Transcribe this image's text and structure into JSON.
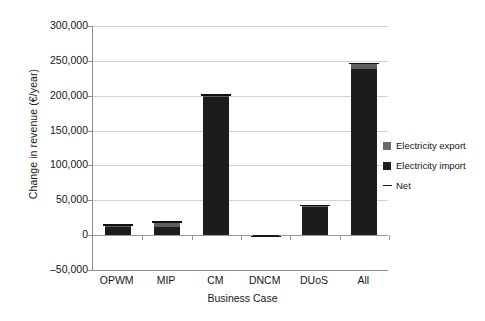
{
  "chart_data": {
    "type": "bar",
    "title": "",
    "subtitle": "",
    "xlabel": "Business Case",
    "ylabel": "Change in revenue (€/year)",
    "categories": [
      "OPWM",
      "MIP",
      "CM",
      "DNCM",
      "DUoS",
      "All"
    ],
    "ylim": [
      -50000,
      300000
    ],
    "ytick_labels": [
      "300,000",
      "250,000",
      "200,000",
      "150,000",
      "100,000",
      "50,000",
      "0",
      "–50,000"
    ],
    "ytick_values": [
      300000,
      250000,
      200000,
      150000,
      100000,
      50000,
      0,
      -50000
    ],
    "grid": true,
    "stacked": true,
    "legend_position": "right",
    "series": [
      {
        "name": "Electricity import",
        "color": "#1c1c1c",
        "values": [
          13000,
          11000,
          199000,
          -2000,
          40000,
          238000
        ]
      },
      {
        "name": "Electricity export",
        "color": "#5e5e5e",
        "values": [
          1500,
          8000,
          2000,
          0,
          2500,
          8000
        ]
      }
    ],
    "net": {
      "name": "Net",
      "color": "#111111",
      "values": [
        14500,
        19000,
        201000,
        -2000,
        42500,
        246000
      ]
    },
    "legend_entries": [
      {
        "label": "Electricity export",
        "marker": "square",
        "color": "#6a6a6a"
      },
      {
        "label": "Electricity import",
        "marker": "square",
        "color": "#1c1c1c"
      },
      {
        "label": "Net",
        "marker": "dash",
        "color": "#1c1c1c"
      }
    ]
  },
  "axes": {
    "y_title": "Change in revenue (€/year)",
    "x_title": "Business Case"
  }
}
